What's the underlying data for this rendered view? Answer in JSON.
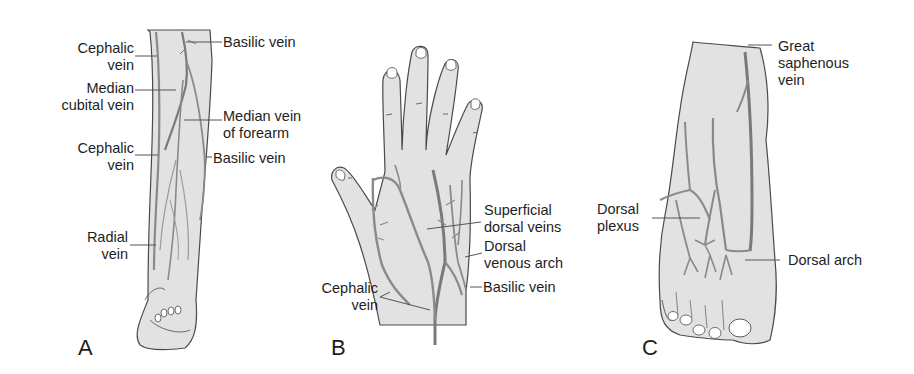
{
  "figure": {
    "colors": {
      "skin": "#e2e2e2",
      "outline": "#4a4a4a",
      "vein": "#8a8a8a",
      "vein_dark": "#5e5e5e",
      "leader": "#555555",
      "text": "#1e1e1e"
    },
    "panels": [
      {
        "id": "A",
        "letter": "A",
        "subject": "forearm",
        "labels": [
          {
            "text": "Basilic vein"
          },
          {
            "text": "Cephalic\nvein"
          },
          {
            "text": "Median\ncubital vein"
          },
          {
            "text": "Median vein\nof forearm"
          },
          {
            "text": "Cephalic\nvein"
          },
          {
            "text": "Basilic vein"
          },
          {
            "text": "Radial\nvein"
          }
        ]
      },
      {
        "id": "B",
        "letter": "B",
        "subject": "hand",
        "labels": [
          {
            "text": "Superficial\ndorsal veins"
          },
          {
            "text": "Dorsal\nvenous arch"
          },
          {
            "text": "Basilic vein"
          },
          {
            "text": "Cephalic\nvein"
          }
        ]
      },
      {
        "id": "C",
        "letter": "C",
        "subject": "foot",
        "labels": [
          {
            "text": "Great\nsaphenous\nvein"
          },
          {
            "text": "Dorsal\nplexus"
          },
          {
            "text": "Dorsal arch"
          }
        ]
      }
    ]
  }
}
